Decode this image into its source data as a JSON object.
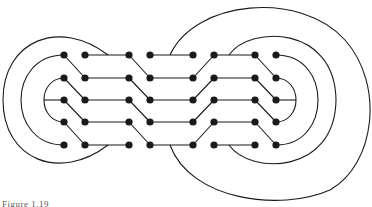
{
  "figure": {
    "caption": "Figure 1.19",
    "stroke_color": "#1a1a1a",
    "background": "#ffffff",
    "rows_y": [
      55,
      78,
      100,
      122,
      145
    ],
    "columns_x": [
      64,
      85,
      129,
      150,
      193,
      214,
      255,
      276
    ],
    "node_count": 40
  }
}
